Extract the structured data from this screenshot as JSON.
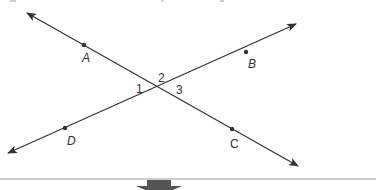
{
  "figure": {
    "type": "intersecting-lines",
    "colors": {
      "line": "#333333",
      "label": "#333333",
      "divider": "#9a9a9a",
      "down_arrow": "#555555"
    },
    "lines": [
      {
        "name": "line-AC",
        "from": [
          27,
          13
        ],
        "to": [
          298,
          166
        ],
        "arrows": "both"
      },
      {
        "name": "line-DB",
        "from": [
          8,
          153
        ],
        "to": [
          296,
          24
        ],
        "arrows": "both"
      }
    ],
    "points": [
      {
        "id": "A",
        "label": "A",
        "x": 84,
        "y": 45,
        "label_x": 82,
        "label_y": 62,
        "italic": true
      },
      {
        "id": "B",
        "label": "B",
        "x": 246,
        "y": 52,
        "label_x": 248,
        "label_y": 68,
        "italic": true
      },
      {
        "id": "C",
        "label": "C",
        "x": 232,
        "y": 129,
        "label_x": 230,
        "label_y": 148,
        "italic": false
      },
      {
        "id": "D",
        "label": "D",
        "x": 65,
        "y": 128,
        "label_x": 67,
        "label_y": 145,
        "italic": true
      }
    ],
    "angles": [
      {
        "id": "angle-1",
        "label": "1",
        "x": 136,
        "y": 93
      },
      {
        "id": "angle-2",
        "label": "2",
        "x": 158,
        "y": 82
      },
      {
        "id": "angle-3",
        "label": "3",
        "x": 176,
        "y": 94
      }
    ],
    "divider": {
      "y": 179
    },
    "down_arrow": {
      "center_x": 159,
      "top": 180
    }
  }
}
